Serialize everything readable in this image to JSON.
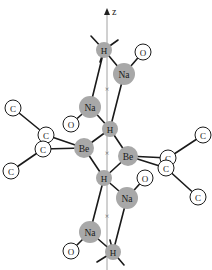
{
  "figure": {
    "axis": {
      "label": "z",
      "x": 107,
      "y_top": 8,
      "y_bottom": 270
    },
    "axis_markers": [
      {
        "symbol": "×",
        "x": 107,
        "y": 88
      },
      {
        "symbol": "×",
        "x": 107,
        "y": 152
      },
      {
        "symbol": "×",
        "x": 107,
        "y": 215
      }
    ],
    "atoms": [
      {
        "id": "H1",
        "element": "H",
        "x": 104,
        "y": 50,
        "r": 8,
        "style": "gray"
      },
      {
        "id": "O1",
        "element": "O",
        "x": 143,
        "y": 52,
        "r": 8,
        "style": "white"
      },
      {
        "id": "Na1",
        "element": "Na",
        "x": 124,
        "y": 74,
        "r": 11,
        "style": "gray"
      },
      {
        "id": "Na2",
        "element": "Na",
        "x": 90,
        "y": 107,
        "r": 11,
        "style": "gray"
      },
      {
        "id": "O2",
        "element": "O",
        "x": 71,
        "y": 124,
        "r": 8,
        "style": "white"
      },
      {
        "id": "H2",
        "element": "H",
        "x": 110,
        "y": 129,
        "r": 8,
        "style": "gray"
      },
      {
        "id": "C1",
        "element": "C",
        "x": 13,
        "y": 108,
        "r": 8,
        "style": "white"
      },
      {
        "id": "C2",
        "element": "C",
        "x": 46,
        "y": 135,
        "r": 8,
        "style": "white"
      },
      {
        "id": "C3",
        "element": "C",
        "x": 43,
        "y": 149,
        "r": 8,
        "style": "white"
      },
      {
        "id": "C4",
        "element": "C",
        "x": 11,
        "y": 171,
        "r": 8,
        "style": "white"
      },
      {
        "id": "Be1",
        "element": "Be",
        "x": 84,
        "y": 148,
        "r": 10,
        "style": "gray"
      },
      {
        "id": "Be2",
        "element": "Be",
        "x": 128,
        "y": 156,
        "r": 10,
        "style": "gray"
      },
      {
        "id": "C5",
        "element": "C",
        "x": 203,
        "y": 135,
        "r": 8,
        "style": "white"
      },
      {
        "id": "C6",
        "element": "C",
        "x": 168,
        "y": 158,
        "r": 8,
        "style": "white"
      },
      {
        "id": "C7",
        "element": "C",
        "x": 166,
        "y": 168,
        "r": 8,
        "style": "white"
      },
      {
        "id": "C8",
        "element": "C",
        "x": 198,
        "y": 197,
        "r": 8,
        "style": "white"
      },
      {
        "id": "H3",
        "element": "H",
        "x": 104,
        "y": 178,
        "r": 8,
        "style": "gray"
      },
      {
        "id": "O3",
        "element": "O",
        "x": 145,
        "y": 178,
        "r": 8,
        "style": "white"
      },
      {
        "id": "Na3",
        "element": "Na",
        "x": 127,
        "y": 198,
        "r": 11,
        "style": "gray"
      },
      {
        "id": "Na4",
        "element": "Na",
        "x": 90,
        "y": 232,
        "r": 11,
        "style": "gray"
      },
      {
        "id": "O4",
        "element": "O",
        "x": 71,
        "y": 251,
        "r": 8,
        "style": "white"
      },
      {
        "id": "H4",
        "element": "H",
        "x": 113,
        "y": 252,
        "r": 8,
        "style": "gray"
      }
    ],
    "bonds": [
      [
        "H1",
        "Na1"
      ],
      [
        "H1",
        "Na2"
      ],
      [
        "Na1",
        "O1"
      ],
      [
        "Na1",
        "H2"
      ],
      [
        "Na2",
        "O2"
      ],
      [
        "Na2",
        "H2"
      ],
      [
        "H2",
        "Be1"
      ],
      [
        "H2",
        "Be2"
      ],
      [
        "Be1",
        "C2"
      ],
      [
        "Be1",
        "C3"
      ],
      [
        "C2",
        "C1"
      ],
      [
        "C3",
        "C4"
      ],
      [
        "Be2",
        "C6"
      ],
      [
        "Be2",
        "C7"
      ],
      [
        "C6",
        "C5"
      ],
      [
        "C7",
        "C8"
      ],
      [
        "Be1",
        "H3"
      ],
      [
        "Be2",
        "H3"
      ],
      [
        "H3",
        "Na3"
      ],
      [
        "H3",
        "Na4"
      ],
      [
        "Na3",
        "O3"
      ],
      [
        "Na3",
        "H4"
      ],
      [
        "Na4",
        "O4"
      ],
      [
        "Na4",
        "H4"
      ]
    ],
    "stubs": [
      {
        "x1": 104,
        "y1": 50,
        "x2": 91,
        "y2": 36
      },
      {
        "x1": 104,
        "y1": 50,
        "x2": 118,
        "y2": 40
      },
      {
        "x1": 104,
        "y1": 50,
        "x2": 100,
        "y2": 62
      },
      {
        "x1": 113,
        "y1": 252,
        "x2": 97,
        "y2": 262
      },
      {
        "x1": 113,
        "y1": 252,
        "x2": 124,
        "y2": 265
      },
      {
        "x1": 113,
        "y1": 252,
        "x2": 110,
        "y2": 240
      }
    ]
  }
}
